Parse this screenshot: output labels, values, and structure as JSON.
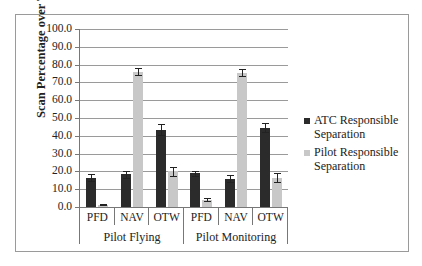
{
  "chart_data": {
    "type": "bar",
    "title": "",
    "xlabel": "",
    "ylabel": "Scan Percentage over Total Alert Phase",
    "ylim": [
      0,
      100
    ],
    "yticks": [
      "0.0",
      "10.0",
      "20.0",
      "30.0",
      "40.0",
      "50.0",
      "60.0",
      "70.0",
      "80.0",
      "90.0",
      "100.0"
    ],
    "grid": true,
    "legend_position": "right",
    "groups": [
      "Pilot Flying",
      "Pilot Monitoring"
    ],
    "categories": [
      "PFD",
      "NAV",
      "OTW",
      "PFD",
      "NAV",
      "OTW"
    ],
    "series": [
      {
        "name": "ATC Responsible Separation",
        "color": "#2b2b2b",
        "values": [
          16.5,
          18.5,
          43.5,
          19.0,
          16.0,
          44.5
        ],
        "errors": [
          2.0,
          2.0,
          3.0,
          1.5,
          1.8,
          2.5
        ]
      },
      {
        "name": "Pilot Responsible Separation",
        "color": "#c8c8c8",
        "values": [
          1.2,
          76.0,
          20.0,
          4.0,
          75.5,
          16.5
        ],
        "errors": [
          0.3,
          2.0,
          2.5,
          0.8,
          2.0,
          2.5
        ]
      }
    ]
  }
}
